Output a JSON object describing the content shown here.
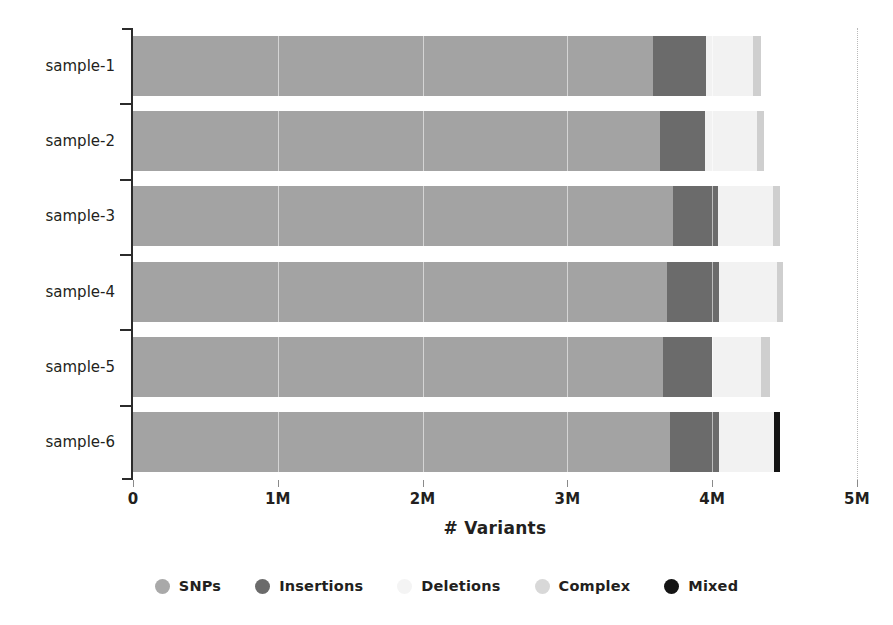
{
  "chart_data": {
    "type": "bar",
    "orientation": "horizontal",
    "stacked": true,
    "title": "",
    "xlabel": "# Variants",
    "ylabel": "",
    "xlim": [
      0,
      5000000
    ],
    "xticks": [
      0,
      1000000,
      2000000,
      3000000,
      4000000,
      5000000
    ],
    "xtick_labels": [
      "0",
      "1M",
      "2M",
      "3M",
      "4M",
      "5M"
    ],
    "grid": "dotted-vertical-at-5M",
    "legend_position": "bottom-center",
    "categories": [
      "sample-1",
      "sample-2",
      "sample-3",
      "sample-4",
      "sample-5",
      "sample-6"
    ],
    "series": [
      {
        "name": "SNPs",
        "color": "#a3a3a3",
        "values": [
          3590000,
          3640000,
          3730000,
          3690000,
          3660000,
          3710000
        ]
      },
      {
        "name": "Insertions",
        "color": "#6b6b6b",
        "values": [
          370000,
          310000,
          310000,
          360000,
          340000,
          340000
        ]
      },
      {
        "name": "Deletions",
        "color": "#f2f2f2",
        "values": [
          320000,
          360000,
          380000,
          400000,
          340000,
          380000
        ]
      },
      {
        "name": "Complex",
        "color": "#cfcfcf",
        "values": [
          60000,
          50000,
          50000,
          40000,
          60000,
          0
        ]
      },
      {
        "name": "Mixed",
        "color": "#141414",
        "values": [
          0,
          0,
          0,
          0,
          0,
          40000
        ]
      }
    ],
    "totals": [
      4340000,
      4360000,
      4470000,
      4490000,
      4400000,
      4470000
    ]
  },
  "legend": {
    "items": [
      {
        "label": "SNPs",
        "color": "#a9a9a9"
      },
      {
        "label": "Insertions",
        "color": "#6b6b6b"
      },
      {
        "label": "Deletions",
        "color": "#f4f4f4"
      },
      {
        "label": "Complex",
        "color": "#d8d8d8"
      },
      {
        "label": "Mixed",
        "color": "#141414"
      }
    ]
  },
  "axis": {
    "x_title": "# Variants"
  },
  "colors": {
    "snps": "#a3a3a3",
    "insertions": "#6b6b6b",
    "deletions": "#f2f2f2",
    "complex": "#cfcfcf",
    "mixed": "#141414",
    "axis": "#2b2b2b",
    "text": "#231f20",
    "gridline": "#b9b9b9",
    "background": "#ffffff"
  }
}
